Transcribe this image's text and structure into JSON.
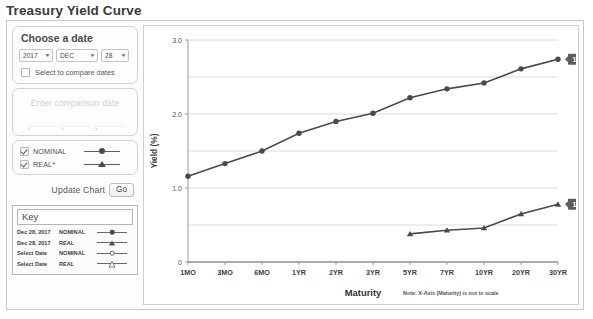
{
  "page_title": "Treasury Yield Curve",
  "sidebar": {
    "date_panel": {
      "heading": "Choose a date",
      "year": "2017",
      "month": "DEC",
      "day": "28",
      "compare_checkbox_label": "Select to compare dates",
      "compare_checked": false
    },
    "comparison_panel": {
      "placeholder": "Enter comparison date",
      "disabled": true
    },
    "series_panel": {
      "items": [
        {
          "label": "NOMINAL",
          "checked": true,
          "marker": "filled-circle"
        },
        {
          "label": "REAL*",
          "checked": true,
          "marker": "filled-triangle"
        }
      ]
    },
    "update": {
      "label": "Update Chart",
      "button_label": "Go"
    },
    "key": {
      "title": "Key",
      "rows": [
        {
          "date": "Dec 28, 2017",
          "type": "NOMINAL",
          "marker": "filled-circle"
        },
        {
          "date": "Dec 28, 2017",
          "type": "REAL",
          "marker": "filled-triangle"
        },
        {
          "date": "Select Date",
          "type": "NOMINAL",
          "marker": "open-circle"
        },
        {
          "date": "Select Date",
          "type": "REAL",
          "marker": "open-triangle"
        }
      ]
    }
  },
  "chart_data": {
    "type": "line",
    "title": "",
    "xlabel": "Maturity",
    "ylabel": "Yield (%)",
    "note": "Note: X-Axis (Maturity) is not to scale",
    "categories": [
      "1MO",
      "3MO",
      "6MO",
      "1YR",
      "2YR",
      "3YR",
      "5YR",
      "7YR",
      "10YR",
      "20YR",
      "30YR"
    ],
    "ylim": [
      0,
      3.0
    ],
    "yticks": [
      0,
      1.0,
      2.0,
      3.0
    ],
    "ytick_labels": [
      "0",
      "1.0",
      "2.0",
      "3.0"
    ],
    "gridlines": [
      0.5,
      1.0,
      1.5,
      2.0,
      2.5,
      3.0
    ],
    "grid": true,
    "legend_position": "sidebar-key",
    "series": [
      {
        "name": "NOMINAL",
        "date": "12/28/2017",
        "marker": "filled-circle",
        "color": "#4a4a4a",
        "values": [
          1.16,
          1.33,
          1.5,
          1.74,
          1.9,
          2.01,
          2.22,
          2.34,
          2.42,
          2.61,
          2.74
        ]
      },
      {
        "name": "REAL",
        "date": "12/28/2017",
        "marker": "filled-triangle",
        "color": "#4a4a4a",
        "values": [
          null,
          null,
          null,
          null,
          null,
          null,
          0.38,
          0.43,
          0.46,
          0.65,
          0.78
        ]
      }
    ],
    "callouts": [
      {
        "label": "12/28/2017",
        "series": "NOMINAL",
        "category": "30YR"
      },
      {
        "label": "12/28/2017",
        "series": "REAL",
        "category": "30YR"
      }
    ]
  },
  "colors": {
    "series": "#4a4a4a",
    "callout_bg": "#5c5c5c",
    "grid": "#d8dde4",
    "axis": "#9a9a9a"
  }
}
